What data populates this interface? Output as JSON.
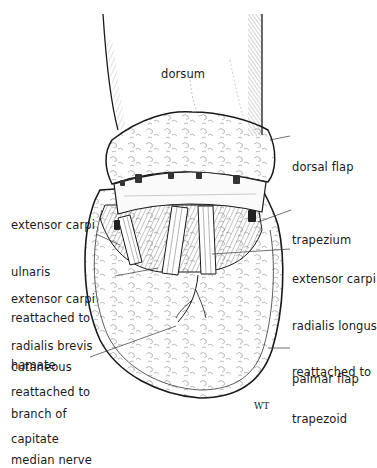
{
  "figure": {
    "type": "surgical illustration",
    "signature": "WT",
    "labels": {
      "dorsum": {
        "lines": [
          "dorsum"
        ]
      },
      "dorsal_flap": {
        "lines": [
          "dorsal flap"
        ]
      },
      "trapezium": {
        "lines": [
          "trapezium"
        ]
      },
      "ecu": {
        "lines": [
          "extensor carpi",
          "ulnaris",
          "reattached to",
          "hamate"
        ]
      },
      "ecrb": {
        "lines": [
          "extensor carpi",
          "radialis brevis",
          "reattached to",
          "capitate"
        ]
      },
      "ecrl": {
        "lines": [
          "extensor carpi",
          "radialis longus",
          "reattached to",
          "trapezoid"
        ]
      },
      "cutaneous": {
        "lines": [
          "cutaneous",
          "branch of",
          "median nerve"
        ]
      },
      "palmar_flap": {
        "lines": [
          "palmar flap"
        ]
      }
    },
    "colors": {
      "ink": "#1a1a1a",
      "hatch": "#555555",
      "background": "#ffffff"
    }
  }
}
